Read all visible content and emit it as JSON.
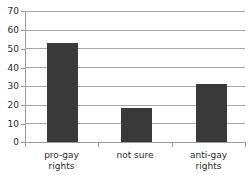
{
  "chart_data": {
    "type": "bar",
    "title": "",
    "subtitle": "",
    "xlabel": "",
    "ylabel": "",
    "categories": [
      "pro-gay rights",
      "not sure",
      "anti-gay rights"
    ],
    "category_lines": [
      [
        "pro-gay",
        "rights"
      ],
      [
        "not sure"
      ],
      [
        "anti-gay",
        "rights"
      ]
    ],
    "values": [
      53,
      18,
      31
    ],
    "ylim": [
      0,
      70
    ],
    "yticks": [
      0,
      10,
      20,
      30,
      40,
      50,
      60,
      70
    ],
    "ytick_labels": [
      "0",
      "10",
      "20",
      "30",
      "40",
      "50",
      "60",
      "70"
    ],
    "grid": true,
    "grid_axis": "y",
    "legend": false,
    "legend_position": "none",
    "bar_color": "#3a3a3a",
    "grid_color": "#a8a8a8",
    "axis_color": "#9a9a9a",
    "background": "#ffffff"
  }
}
